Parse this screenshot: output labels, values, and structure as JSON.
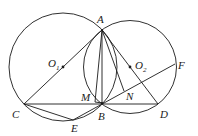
{
  "figure": {
    "circles": [
      {
        "name": "O1",
        "cx": 63,
        "cy": 67,
        "r": 54
      },
      {
        "name": "O2",
        "cx": 130,
        "cy": 67,
        "r": 46.5
      }
    ],
    "points": {
      "A": {
        "label": "A",
        "x": 102,
        "y": 30
      },
      "B": {
        "label": "B",
        "x": 102,
        "y": 103
      },
      "C": {
        "label": "C",
        "x": 24,
        "y": 104
      },
      "D": {
        "label": "D",
        "x": 158,
        "y": 104
      },
      "E": {
        "label": "E",
        "x": 73,
        "y": 120
      },
      "F": {
        "label": "F",
        "x": 175,
        "y": 64
      },
      "M": {
        "label": "M",
        "x": 95,
        "y": 101
      },
      "N": {
        "label": "N",
        "x": 124,
        "y": 91
      },
      "O1": {
        "label": "O",
        "sub": "1",
        "x": 63,
        "y": 67
      },
      "O2": {
        "label": "O",
        "sub": "2",
        "x": 130,
        "y": 67
      }
    },
    "segments": [
      "AC",
      "AD",
      "AM",
      "AB",
      "AN",
      "CD",
      "CE",
      "EB",
      "EF"
    ]
  }
}
